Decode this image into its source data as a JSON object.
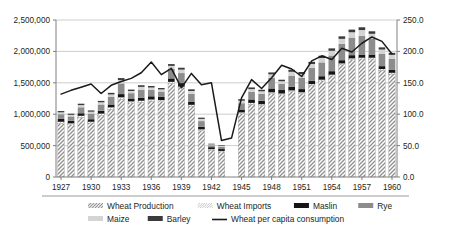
{
  "chart_data": {
    "type": "bar",
    "subtype": "stacked-bar-with-line-overlay",
    "title": "",
    "xlabel": "",
    "ylabel": "",
    "y2label": "",
    "grid": true,
    "legend_position": "bottom",
    "ylim": [
      0,
      2500000
    ],
    "y2lim": [
      0,
      250
    ],
    "y_ticks": [
      "0",
      "500,000",
      "1,000,000",
      "1,500,000",
      "2,000,000",
      "2,500,000"
    ],
    "y_tick_values": [
      0,
      500000,
      1000000,
      1500000,
      2000000,
      2500000
    ],
    "y2_ticks": [
      "0.0",
      "50.0",
      "100.0",
      "150.0",
      "200.0",
      "250.0"
    ],
    "y2_tick_values": [
      0,
      50,
      100,
      150,
      200,
      250
    ],
    "x_tick_labels": [
      "1927",
      "1930",
      "1933",
      "1936",
      "1939",
      "1942",
      "1945",
      "1948",
      "1951",
      "1954",
      "1957",
      "1960"
    ],
    "categories": [
      "1927",
      "1928",
      "1929",
      "1930",
      "1931",
      "1932",
      "1933",
      "1934",
      "1935",
      "1936",
      "1937",
      "1938",
      "1939",
      "1940",
      "1941",
      "1942",
      "1943",
      "1944",
      "1945",
      "1946",
      "1947",
      "1948",
      "1949",
      "1950",
      "1951",
      "1952",
      "1953",
      "1954",
      "1955",
      "1956",
      "1957",
      "1958",
      "1959",
      "1960"
    ],
    "series": [
      {
        "name": "Wheat Production",
        "pattern": "diagonal-hatch",
        "color": "#a8a8a8",
        "values": [
          850000,
          830000,
          950000,
          860000,
          980000,
          1080000,
          1240000,
          1180000,
          1190000,
          1210000,
          1200000,
          1490000,
          1420000,
          1130000,
          740000,
          430000,
          400000,
          null,
          1010000,
          1160000,
          1140000,
          1330000,
          1310000,
          1360000,
          1330000,
          1460000,
          1530000,
          1610000,
          1790000,
          1870000,
          1880000,
          1880000,
          1700000,
          1640000
        ]
      },
      {
        "name": "Wheat Imports",
        "pattern": "fine-hatch",
        "color": "#c9c9c9",
        "values": [
          30000,
          25000,
          25000,
          20000,
          30000,
          30000,
          30000,
          25000,
          25000,
          25000,
          25000,
          25000,
          20000,
          20000,
          20000,
          15000,
          15000,
          null,
          20000,
          20000,
          20000,
          20000,
          20000,
          20000,
          20000,
          20000,
          20000,
          20000,
          20000,
          20000,
          20000,
          20000,
          20000,
          20000
        ]
      },
      {
        "name": "Maslin",
        "pattern": "solid",
        "color": "#151515",
        "values": [
          45000,
          40000,
          40000,
          40000,
          45000,
          45000,
          50000,
          45000,
          45000,
          50000,
          50000,
          55000,
          55000,
          45000,
          40000,
          30000,
          30000,
          null,
          45000,
          55000,
          55000,
          60000,
          55000,
          55000,
          50000,
          55000,
          55000,
          55000,
          50000,
          50000,
          50000,
          50000,
          45000,
          45000
        ]
      },
      {
        "name": "Rye",
        "pattern": "solid",
        "color": "#8c8c8c",
        "values": [
          75000,
          70000,
          95000,
          90000,
          100000,
          120000,
          170000,
          85000,
          130000,
          100000,
          85000,
          150000,
          160000,
          130000,
          90000,
          30000,
          35000,
          null,
          100000,
          120000,
          110000,
          170000,
          100000,
          180000,
          180000,
          200000,
          220000,
          250000,
          260000,
          280000,
          300000,
          250000,
          200000,
          180000
        ]
      },
      {
        "name": "Maize",
        "pattern": "solid",
        "color": "#d4d4d4",
        "values": [
          30000,
          25000,
          35000,
          30000,
          35000,
          40000,
          55000,
          35000,
          45000,
          40000,
          35000,
          50000,
          55000,
          45000,
          35000,
          15000,
          15000,
          null,
          40000,
          45000,
          40000,
          55000,
          40000,
          60000,
          60000,
          65000,
          70000,
          75000,
          80000,
          85000,
          90000,
          80000,
          65000,
          60000
        ]
      },
      {
        "name": "Barley",
        "pattern": "solid",
        "color": "#3a3a3a",
        "values": [
          20000,
          18000,
          22000,
          20000,
          22000,
          25000,
          30000,
          22000,
          26000,
          24000,
          22000,
          28000,
          30000,
          26000,
          20000,
          10000,
          10000,
          null,
          24000,
          26000,
          24000,
          30000,
          24000,
          32000,
          32000,
          34000,
          36000,
          38000,
          40000,
          42000,
          44000,
          40000,
          34000,
          32000
        ]
      }
    ],
    "line_series": {
      "name": "Wheat per capita consumption",
      "color": "#1a1a1a",
      "axis": "right",
      "unit": "",
      "values": [
        132.0,
        138.0,
        143.0,
        148.0,
        133.0,
        146.0,
        152.0,
        157.0,
        166.0,
        183.0,
        163.0,
        173.0,
        142.0,
        165.0,
        147.0,
        150.0,
        58.0,
        62.0,
        126.0,
        155.0,
        141.0,
        158.0,
        178.0,
        172.0,
        160.0,
        185.0,
        193.0,
        187.0,
        205.0,
        199.0,
        213.0,
        223.0,
        216.0,
        196.0
      ]
    }
  },
  "legend": {
    "items": [
      {
        "label": "Wheat Production",
        "swatch": "diagonal-hatch",
        "color": "#a8a8a8"
      },
      {
        "label": "Wheat Imports",
        "swatch": "fine-hatch",
        "color": "#c9c9c9"
      },
      {
        "label": "Maslin",
        "swatch": "solid",
        "color": "#151515"
      },
      {
        "label": "Rye",
        "swatch": "solid",
        "color": "#8c8c8c"
      },
      {
        "label": "Maize",
        "swatch": "solid",
        "color": "#d4d4d4"
      },
      {
        "label": "Barley",
        "swatch": "solid",
        "color": "#3a3a3a"
      },
      {
        "label": "Wheat per capita consumption",
        "swatch": "line",
        "color": "#1a1a1a"
      }
    ]
  },
  "colors": {
    "plot_background": "#ffffff",
    "gridline": "#c0c0c0",
    "axis": "#808080",
    "text": "#231f20"
  }
}
